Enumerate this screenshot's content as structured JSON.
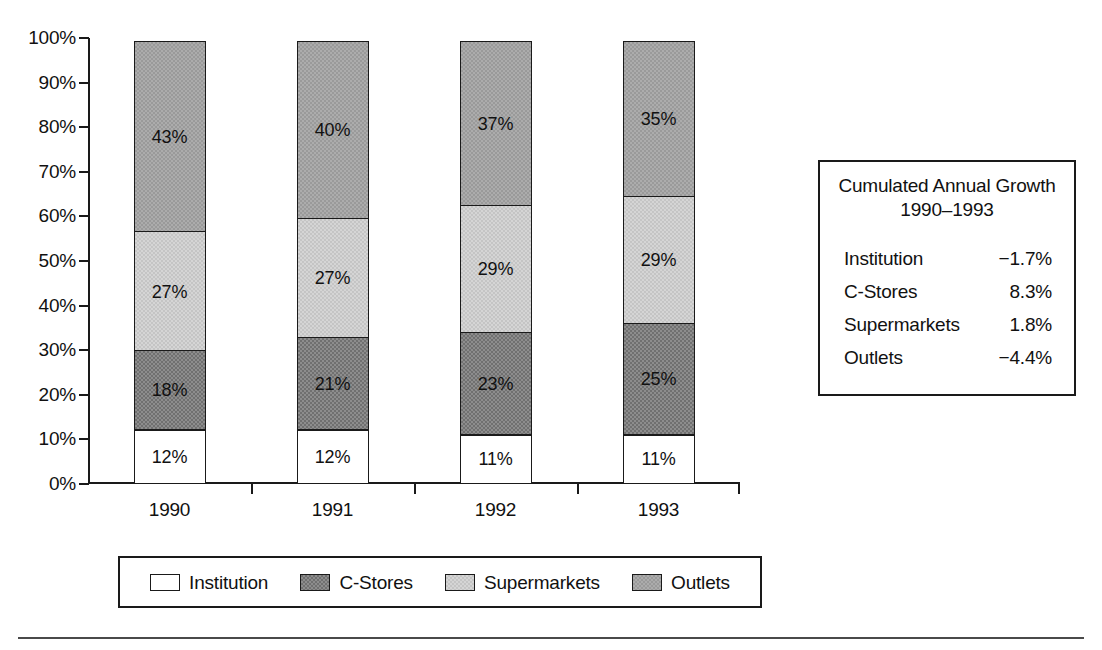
{
  "chart_data": {
    "type": "bar",
    "subtype": "stacked-percent-column",
    "title": "",
    "xlabel": "",
    "ylabel": "",
    "ylim": [
      0,
      100
    ],
    "ytick_labels": [
      "0%",
      "10%",
      "20%",
      "30%",
      "40%",
      "50%",
      "60%",
      "70%",
      "80%",
      "90%",
      "100%"
    ],
    "ytick_values": [
      0,
      10,
      20,
      30,
      40,
      50,
      60,
      70,
      80,
      90,
      100
    ],
    "grid": false,
    "legend_position": "bottom",
    "categories": [
      "1990",
      "1991",
      "1992",
      "1993"
    ],
    "series": [
      {
        "name": "Institution",
        "color": "#ffffff",
        "values": [
          12,
          12,
          11,
          11
        ],
        "labels": [
          "12%",
          "12%",
          "11%",
          "11%"
        ]
      },
      {
        "name": "C-Stores",
        "color": "#707070",
        "values": [
          18,
          21,
          23,
          25
        ],
        "labels": [
          "18%",
          "21%",
          "23%",
          "25%"
        ]
      },
      {
        "name": "Supermarkets",
        "color": "#d5d5d5",
        "values": [
          27,
          27,
          29,
          29
        ],
        "labels": [
          "27%",
          "27%",
          "29%",
          "29%"
        ]
      },
      {
        "name": "Outlets",
        "color": "#9a9a9a",
        "values": [
          43,
          40,
          37,
          35
        ],
        "labels": [
          "43%",
          "40%",
          "37%",
          "35%"
        ]
      }
    ],
    "annotations": {
      "growth_table": {
        "title_line1": "Cumulated Annual Growth",
        "title_line2": "1990–1993",
        "rows": [
          {
            "label": "Institution",
            "value": "−1.7%"
          },
          {
            "label": "C-Stores",
            "value": "8.3%"
          },
          {
            "label": "Supermarkets",
            "value": "1.8%"
          },
          {
            "label": "Outlets",
            "value": "−4.4%"
          }
        ]
      }
    }
  },
  "legend": {
    "items": [
      {
        "label": "Institution",
        "swatch": "institution"
      },
      {
        "label": "C-Stores",
        "swatch": "cstores"
      },
      {
        "label": "Supermarkets",
        "swatch": "supermarkets"
      },
      {
        "label": "Outlets",
        "swatch": "outlets"
      }
    ]
  }
}
